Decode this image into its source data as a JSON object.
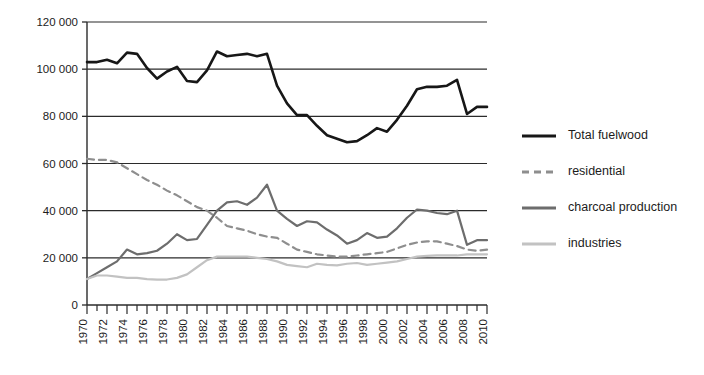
{
  "chart_data": {
    "type": "line",
    "title": "",
    "xlabel": "",
    "ylabel": "",
    "x": [
      1970,
      1971,
      1972,
      1973,
      1974,
      1975,
      1976,
      1977,
      1978,
      1979,
      1980,
      1981,
      1982,
      1983,
      1984,
      1985,
      1986,
      1987,
      1988,
      1989,
      1990,
      1991,
      1992,
      1993,
      1994,
      1995,
      1996,
      1997,
      1998,
      1999,
      2000,
      2001,
      2002,
      2003,
      2004,
      2005,
      2006,
      2007,
      2008,
      2009,
      2010
    ],
    "xlim": [
      1970,
      2010
    ],
    "ylim": [
      0,
      120000
    ],
    "yticks": [
      0,
      20000,
      40000,
      60000,
      80000,
      100000,
      120000
    ],
    "ytick_labels": [
      "0",
      "20 000",
      "40 000",
      "60 000",
      "80 000",
      "100 000",
      "120 000"
    ],
    "xticks": [
      1970,
      1972,
      1974,
      1976,
      1978,
      1980,
      1982,
      1984,
      1986,
      1988,
      1990,
      1992,
      1994,
      1996,
      1998,
      2000,
      2002,
      2004,
      2006,
      2008,
      2010
    ],
    "xtick_labels": [
      "1970",
      "1972",
      "1974",
      "1976",
      "1978",
      "1980",
      "1982",
      "1984",
      "1986",
      "1988",
      "1990",
      "1992",
      "1994",
      "1996",
      "1998",
      "2000",
      "2002",
      "2004",
      "2006",
      "2008",
      "2010"
    ],
    "xtick_minor_every": 1,
    "grid": "horizontal",
    "legend_position": "right",
    "series": [
      {
        "name": "Total fuelwood",
        "color": "#171717",
        "width": 2.6,
        "dash": "none",
        "values": [
          103000,
          103000,
          104000,
          102500,
          107000,
          106500,
          100500,
          96000,
          99000,
          101000,
          95000,
          94500,
          99500,
          107500,
          105500,
          106000,
          106500,
          105500,
          106500,
          93000,
          85500,
          80500,
          80500,
          76000,
          72000,
          70500,
          69000,
          69500,
          72000,
          75000,
          73500,
          78500,
          84500,
          91500,
          92500,
          92500,
          93000,
          95500,
          81000,
          84000,
          84000
        ]
      },
      {
        "name": "residential",
        "color": "#8e8e8e",
        "width": 2.2,
        "dash": "dashed",
        "values": [
          62000,
          61500,
          61500,
          60500,
          58000,
          55500,
          53000,
          51000,
          48500,
          46500,
          44000,
          41500,
          40000,
          37000,
          33500,
          32500,
          31500,
          30000,
          29000,
          28500,
          26000,
          23500,
          22500,
          21500,
          21000,
          20500,
          20500,
          21000,
          21500,
          22000,
          22500,
          24000,
          25500,
          26500,
          27000,
          27000,
          26000,
          25000,
          23500,
          23000,
          23500
        ]
      },
      {
        "name": "charcoal production",
        "color": "#6d6d6d",
        "width": 2.2,
        "dash": "none",
        "values": [
          11000,
          13500,
          16000,
          18500,
          23500,
          21500,
          22000,
          23000,
          26000,
          30000,
          27500,
          28000,
          34000,
          40000,
          43500,
          44000,
          42500,
          45500,
          51000,
          40000,
          36500,
          33500,
          35500,
          35000,
          32000,
          29500,
          26000,
          27500,
          30500,
          28500,
          29000,
          32500,
          37000,
          40500,
          40000,
          39000,
          38500,
          40000,
          25500,
          27500,
          27500
        ]
      },
      {
        "name": "industries",
        "color": "#c2c2c2",
        "width": 2.2,
        "dash": "none",
        "values": [
          11000,
          12500,
          12500,
          12000,
          11500,
          11500,
          11000,
          10800,
          10800,
          11500,
          13000,
          16000,
          19000,
          20500,
          20500,
          20500,
          20500,
          20000,
          19500,
          18500,
          17000,
          16500,
          16000,
          17500,
          17000,
          16800,
          17500,
          17800,
          17000,
          17500,
          18000,
          18500,
          19500,
          20500,
          20800,
          21000,
          21000,
          21000,
          21500,
          21500,
          21500
        ]
      }
    ]
  },
  "legend": {
    "items": [
      {
        "label": "Total fuelwood"
      },
      {
        "label": "residential"
      },
      {
        "label": "charcoal production"
      },
      {
        "label": "industries"
      }
    ]
  }
}
